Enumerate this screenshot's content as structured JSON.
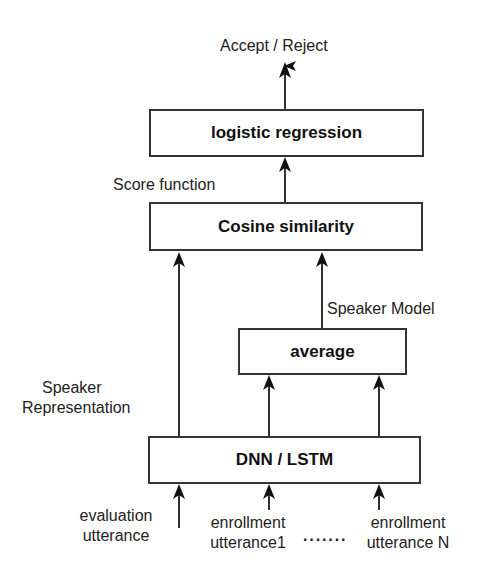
{
  "diagram": {
    "output_label": "Accept / Reject",
    "boxes": {
      "logistic_regression": "logistic regression",
      "cosine_similarity": "Cosine similarity",
      "average": "average",
      "dnn_lstm": "DNN / LSTM"
    },
    "labels": {
      "score_function": "Score function",
      "speaker_model": "Speaker Model",
      "speaker_representation_line1": "Speaker",
      "speaker_representation_line2": "Representation",
      "evaluation_line1": "evaluation",
      "evaluation_line2": "utterance",
      "enrollment1_line1": "enrollment",
      "enrollment1_line2": "utterance1",
      "enrollmentN_line1": "enrollment",
      "enrollmentN_line2": "utterance N",
      "ellipsis": "·······"
    }
  }
}
